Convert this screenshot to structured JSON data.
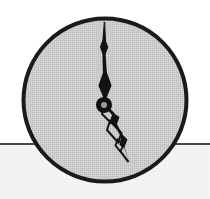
{
  "scene": {
    "title": "Analog wall clock on wall above horizon line",
    "width": 210,
    "height": 199,
    "background_upper_color": "#ffffff",
    "background_lower_color": "#f2f2f2"
  },
  "horizon": {
    "label": "horizontal ledge line",
    "y": 144,
    "x_start": 0,
    "x_end": 210,
    "color": "#4a4a4a",
    "thickness": 2
  },
  "clock": {
    "label": "analog clock",
    "center_x": 105,
    "center_y": 100,
    "radius": 83,
    "rim_color": "#1a1a1a",
    "rim_thickness": 4,
    "face_color": "#c9c9c9",
    "face_texture": "dithered-halftone",
    "has_numerals": false,
    "has_tick_marks": false,
    "hub": {
      "label": "center hub",
      "outer_radius": 8,
      "inner_radius": 3,
      "color": "#111111",
      "inner_color": "#9a9a9a"
    },
    "minute_hand": {
      "label": "minute hand",
      "angle_deg": 0,
      "points_to": "12",
      "length": 82,
      "tip_x": 104,
      "tip_y": 19,
      "color": "#111111",
      "style": "spade-with-lozenge"
    },
    "hour_hand": {
      "label": "hour hand",
      "angle_deg": 157,
      "points_to": "5",
      "length": 62,
      "tip_x": 129,
      "tip_y": 161,
      "color": "#111111",
      "style": "spade-with-lozenge"
    },
    "reading": {
      "time": "5:00",
      "hour": 5,
      "minute": 0
    }
  }
}
